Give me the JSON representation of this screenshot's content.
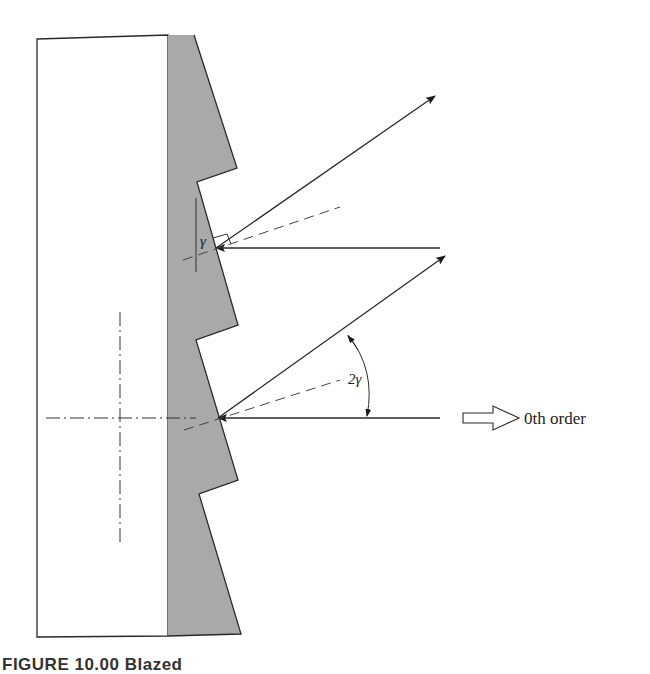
{
  "figure": {
    "type": "blazed diffraction grating cross-section diagram",
    "labels": {
      "facet_angle": "γ",
      "diffraction_angle": "2γ",
      "order_label": "0th order"
    },
    "caption": "FIGURE 10.00 Blazed"
  },
  "colors": {
    "substrate_fill": "#ffffff",
    "grating_fill": "#a9a9a9",
    "line": "#2a2a2a",
    "background": "#ffffff"
  }
}
